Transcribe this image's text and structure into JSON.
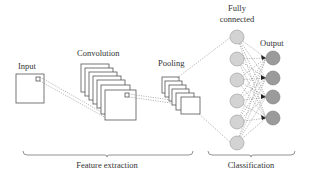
{
  "labels": {
    "input": "Input",
    "convolution": "Convolution",
    "pooling": "Pooling",
    "fully_connected_line1": "Fully",
    "fully_connected_line2": "connected",
    "output": "Output",
    "feature_extraction": "Feature extraction",
    "classification": "Classification"
  },
  "colors": {
    "fc_node_fill": "#d3d3d3",
    "output_node_fill": "#9b9b9b",
    "box_stroke": "#555555",
    "line_color": "#888888"
  },
  "layers": {
    "input": {
      "count": 1
    },
    "convolution": {
      "feature_maps": 7
    },
    "pooling": {
      "feature_maps": 6
    },
    "fully_connected": {
      "nodes": 6
    },
    "output": {
      "nodes": 4
    }
  },
  "groups": [
    {
      "name": "Feature extraction",
      "spans": [
        "Input",
        "Convolution",
        "Pooling"
      ]
    },
    {
      "name": "Classification",
      "spans": [
        "Fully connected",
        "Output"
      ]
    }
  ]
}
